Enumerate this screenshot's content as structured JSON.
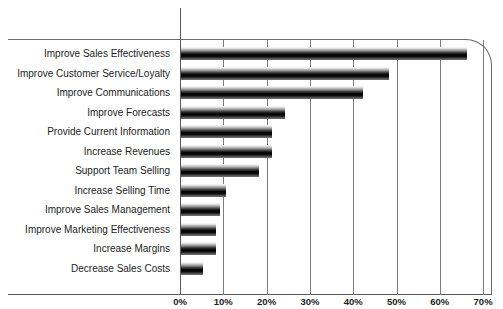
{
  "chart_data": {
    "type": "bar",
    "orientation": "horizontal",
    "title": "",
    "xlabel": "",
    "ylabel": "",
    "xlim": [
      0,
      70
    ],
    "xticks": [
      "0%",
      "10%",
      "20%",
      "30%",
      "40%",
      "50%",
      "60%",
      "70%"
    ],
    "xtick_values": [
      0,
      10,
      20,
      30,
      40,
      50,
      60,
      70
    ],
    "grid": true,
    "legend": null,
    "categories": [
      "Improve Sales Effectiveness",
      "Improve Customer Service/Loyalty",
      "Improve Communications",
      "Improve Forecasts",
      "Provide Current Information",
      "Increase Revenues",
      "Support Team Selling",
      "Increase Selling Time",
      "Improve Sales Management",
      "Improve Marketing Effectiveness",
      "Increase Margins",
      "Decrease Sales Costs"
    ],
    "values": [
      66,
      48,
      42,
      24,
      21,
      21,
      18,
      10.5,
      9,
      8,
      8,
      5
    ],
    "bar_fill": "vertical-gradient-white-to-black",
    "colors": {
      "bar_dark": "#000000",
      "bar_light": "#fdfdfd",
      "gridline": "#7c7c7c",
      "axis": "#5a5a5a",
      "text": "#1d1d1d",
      "background": "#ffffff"
    }
  }
}
